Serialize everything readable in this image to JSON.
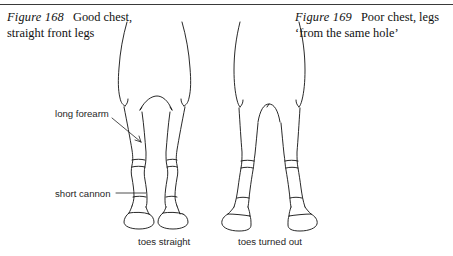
{
  "page": {
    "width": 453,
    "height": 256,
    "background_color": "#ffffff",
    "ink_color": "#111111",
    "rule_color": "#3a3a3a"
  },
  "figures": [
    {
      "id": "figure-168",
      "number_label": "Figure 168",
      "caption_line_1": "Good chest,",
      "caption_line_2": "straight front legs",
      "foot_label": "toes straight",
      "description": "Front view of a horse's chest and forelegs, well-set wide chest with straight parallel legs and forward-pointing hooves"
    },
    {
      "id": "figure-169",
      "number_label": "Figure 169",
      "caption_line_1": "Poor chest, legs",
      "caption_line_2": "‘from the same hole’",
      "foot_label": "toes turned out",
      "description": "Front view of a horse's chest and forelegs, narrow chest with legs set close together and hooves turned outward"
    }
  ],
  "annotations": [
    {
      "id": "long-forearm",
      "label": "long forearm"
    },
    {
      "id": "short-cannon",
      "label": "short cannon"
    }
  ]
}
